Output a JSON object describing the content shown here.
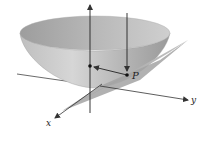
{
  "figure": {
    "labels": {
      "point": "P",
      "x_axis": "x",
      "y_axis": "y"
    },
    "colors": {
      "surface_light": "#d9d9d9",
      "surface_mid": "#bdbdbd",
      "surface_dark": "#8f8f8f",
      "plane": "#a6a6a6",
      "plane_dark": "#8a8a8a",
      "axis": "#333333",
      "background": "#ffffff"
    }
  }
}
